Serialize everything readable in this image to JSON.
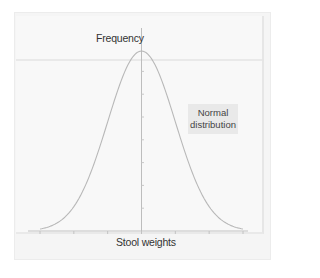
{
  "chart_data": {
    "type": "line",
    "title": "",
    "ylabel": "Frequency",
    "xlabel": "Stool weights",
    "annotation": "Normal distribution",
    "series": [
      {
        "name": "Normal distribution",
        "x": [
          -3,
          -2.5,
          -2,
          -1.5,
          -1,
          -0.5,
          0,
          0.5,
          1,
          1.5,
          2,
          2.5,
          3
        ],
        "values": [
          0.011,
          0.044,
          0.135,
          0.325,
          0.607,
          0.882,
          1.0,
          0.882,
          0.607,
          0.325,
          0.135,
          0.044,
          0.011
        ]
      }
    ],
    "x_ticks": 7,
    "y_ticks": 7,
    "xlim": [
      -3,
      3
    ],
    "ylim": [
      0,
      1.1
    ],
    "grid": false,
    "axis_color": "#bdbdbd",
    "curve_color": "#b5b5b5"
  },
  "labels": {
    "y_axis": "Frequency",
    "x_axis": "Stool weights",
    "legend_line1": "Normal",
    "legend_line2": "distribution"
  }
}
